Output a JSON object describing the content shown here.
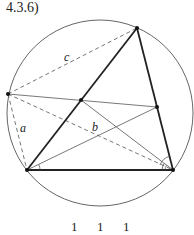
{
  "figure": {
    "label": "4.3.6)"
  },
  "diagram": {
    "circle": {
      "cx": 100,
      "cy": 113,
      "r": 93,
      "stroke": "#555555"
    },
    "points": {
      "A": {
        "x": 27,
        "y": 170
      },
      "B": {
        "x": 173,
        "y": 170
      },
      "C": {
        "x": 137,
        "y": 28
      },
      "P": {
        "x": 8,
        "y": 94
      },
      "M": {
        "x": 81,
        "y": 100
      },
      "Q": {
        "x": 157,
        "y": 107
      }
    },
    "segment_labels": {
      "a": "a",
      "b": "b",
      "c": "c"
    },
    "colors": {
      "thick": "#222222",
      "thin": "#555555",
      "dashed": "#666666"
    }
  },
  "footer": {
    "terms": [
      "1",
      "1",
      "1"
    ]
  }
}
